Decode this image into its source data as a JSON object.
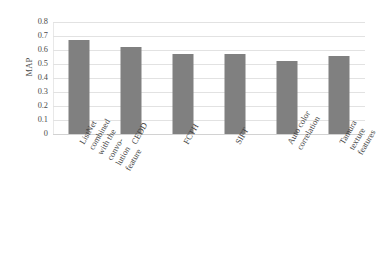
{
  "chart_data": {
    "type": "bar",
    "title": "",
    "subtitle": "",
    "xlabel": "",
    "ylabel": "MAP",
    "ylim": [
      0,
      0.8
    ],
    "ytick_labels": [
      "0.8",
      "0.7",
      "0.6",
      "0.5",
      "0.4",
      "0.3",
      "0.2",
      "0.1",
      "0"
    ],
    "ytick_values": [
      0.8,
      0.7,
      0.6,
      0.5,
      0.4,
      0.3,
      0.2,
      0.1,
      0
    ],
    "grid": true,
    "legend": false,
    "legend_position": "none",
    "orientation": "vertical",
    "bar_color": "#808080",
    "gridline_color": "#e2e2e2",
    "categories": [
      "ListNet combined\nwith the convo-\nlution feature",
      "CEDD",
      "FCTH",
      "SIFT",
      "Auto color\ncorrelation",
      "Tamura\ntexture\nfeatures"
    ],
    "values": [
      0.67,
      0.62,
      0.57,
      0.575,
      0.52,
      0.555
    ],
    "annotations": []
  },
  "axis": {
    "y_title": "MAP"
  }
}
